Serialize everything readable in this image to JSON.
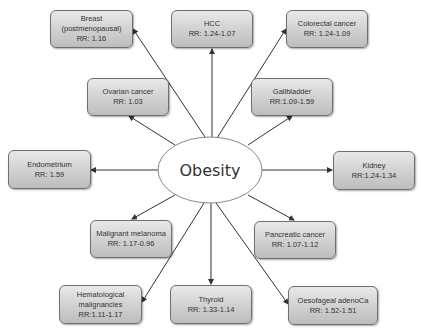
{
  "center": {
    "label": "Obesity"
  },
  "nodes": [
    {
      "id": "breast",
      "lines": [
        "Breast",
        "(postmenopausal)",
        "RR: 1.16"
      ]
    },
    {
      "id": "hcc",
      "lines": [
        "HCC",
        "RR: 1.24-1.07"
      ]
    },
    {
      "id": "colorectal",
      "lines": [
        "Colorectal cancer",
        "RR: 1.24-1.09"
      ]
    },
    {
      "id": "ovarian",
      "lines": [
        "Ovarian cancer",
        "RR: 1.03"
      ]
    },
    {
      "id": "gallbladder",
      "lines": [
        "Gallbladder",
        "RR:1.09-1.59"
      ]
    },
    {
      "id": "endometrium",
      "lines": [
        "Endometrium",
        "RR: 1.59"
      ]
    },
    {
      "id": "kidney",
      "lines": [
        "Kidney",
        "RR:1.24-1.34"
      ]
    },
    {
      "id": "melanoma",
      "lines": [
        "Malignant melanoma",
        "RR: 1.17-0.96"
      ]
    },
    {
      "id": "pancreatic",
      "lines": [
        "Pancreatic cancer",
        "RR: 1.07-1.12"
      ]
    },
    {
      "id": "hematological",
      "lines": [
        "Hematological",
        "malignancies",
        "RR:1.11-1.17"
      ]
    },
    {
      "id": "thyroid",
      "lines": [
        "Thyroid",
        "RR: 1.33-1.14"
      ]
    },
    {
      "id": "oesofageal",
      "lines": [
        "Oesofageal adenoCa",
        "RR: 1.52-1.51"
      ]
    }
  ],
  "colors": {
    "box_top": "#e9e9e9",
    "box_bottom": "#bdbdbd",
    "border": "#6f6f6f",
    "arrow": "#333333",
    "text": "#333333",
    "ellipse_fill": "#ffffff"
  }
}
